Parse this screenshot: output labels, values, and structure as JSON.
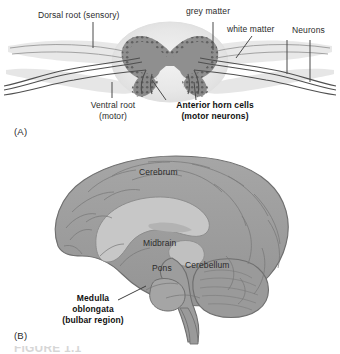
{
  "figure": {
    "panels": [
      {
        "id": "(A)",
        "name": "spinal-cord-cross-section",
        "labels": [
          {
            "key": "dorsal_root",
            "text": "Dorsal root (sensory)",
            "bold": false
          },
          {
            "key": "grey_matter",
            "text": "grey matter",
            "bold": false
          },
          {
            "key": "white_matter",
            "text": "white matter",
            "bold": false
          },
          {
            "key": "neurons",
            "text": "Neurons",
            "bold": false
          },
          {
            "key": "ventral_root_line1",
            "text": "Ventral root",
            "bold": false
          },
          {
            "key": "ventral_root_line2",
            "text": "(motor)",
            "bold": false
          },
          {
            "key": "anterior_horn_line1",
            "text": "Anterior horn cells",
            "bold": true
          },
          {
            "key": "anterior_horn_line2",
            "text": "(motor neurons)",
            "bold": true
          }
        ]
      },
      {
        "id": "(B)",
        "name": "brain-midsagittal-section",
        "labels": [
          {
            "key": "cerebrum",
            "text": "Cerebrum",
            "bold": false
          },
          {
            "key": "midbrain",
            "text": "Midbrain",
            "bold": false
          },
          {
            "key": "pons",
            "text": "Pons",
            "bold": false
          },
          {
            "key": "cerebellum",
            "text": "Cerebellum",
            "bold": false
          },
          {
            "key": "medulla_line1",
            "text": "Medulla",
            "bold": true
          },
          {
            "key": "medulla_line2",
            "text": "oblongata",
            "bold": true
          },
          {
            "key": "medulla_line3",
            "text": "(bulbar region)",
            "bold": true
          }
        ]
      }
    ],
    "caption_partial": "FIGURE 1.1",
    "colors": {
      "grey_matter": "#9a9a9a",
      "white_matter": "#e4e4e4",
      "nerve_sheath": "#c9c9c9",
      "nerve_fiber": "#555555",
      "brain_tissue": "#9d9d9d",
      "brain_inner": "#c2c2c2",
      "outline": "#6f6f6f",
      "label_text": "#2b2b2b",
      "background": "#ffffff"
    }
  }
}
